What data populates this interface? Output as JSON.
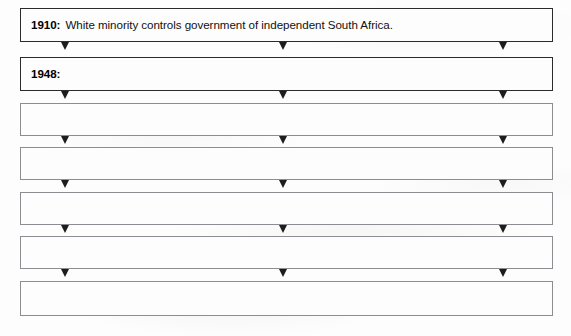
{
  "worksheet": {
    "title": "South Africa apartheid timeline flow chart",
    "background_color": "#fdfdfd",
    "border_color_strong": "#2b2b2b",
    "border_color_light": "#8d8d91",
    "text_color": "#111111",
    "arrow_color": "#1d1d1d",
    "arrow_icon_name": "arrow-down-icon",
    "arrows_per_connector": 3,
    "arrow_x_positions": [
      65,
      283,
      503
    ],
    "steps": [
      {
        "index": 0,
        "year": "1910:",
        "text": "White minority controls government of independent South Africa.",
        "filled": true,
        "border_weight": "strong",
        "top": 8,
        "height": 34
      },
      {
        "index": 1,
        "year": "1948:",
        "text": "",
        "filled": true,
        "border_weight": "strong",
        "top": 57,
        "height": 34
      },
      {
        "index": 2,
        "year": "",
        "text": "",
        "filled": false,
        "border_weight": "light",
        "top": 103,
        "height": 33
      },
      {
        "index": 3,
        "year": "",
        "text": "",
        "filled": false,
        "border_weight": "light",
        "top": 147,
        "height": 33
      },
      {
        "index": 4,
        "year": "",
        "text": "",
        "filled": false,
        "border_weight": "light",
        "top": 192,
        "height": 33
      },
      {
        "index": 5,
        "year": "",
        "text": "",
        "filled": false,
        "border_weight": "light",
        "top": 236,
        "height": 33
      },
      {
        "index": 6,
        "year": "",
        "text": "",
        "filled": false,
        "border_weight": "light",
        "top": 281,
        "height": 35
      }
    ],
    "connectors": [
      {
        "index": 0,
        "top": 42
      },
      {
        "index": 1,
        "top": 91
      },
      {
        "index": 2,
        "top": 136
      },
      {
        "index": 3,
        "top": 180
      },
      {
        "index": 4,
        "top": 225
      },
      {
        "index": 5,
        "top": 269
      }
    ]
  }
}
